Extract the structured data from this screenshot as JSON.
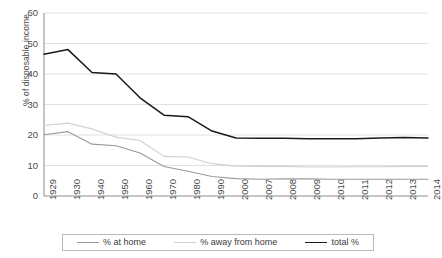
{
  "chart_data": {
    "type": "line",
    "title": "",
    "xlabel": "",
    "ylabel": "% of disposable income",
    "ylim": [
      0,
      60
    ],
    "yticks": [
      0,
      10,
      20,
      30,
      40,
      50,
      60
    ],
    "grid": true,
    "legend_position": "bottom",
    "categories": [
      "1929",
      "1930",
      "1940",
      "1950",
      "1960",
      "1970",
      "1980",
      "1990",
      "2000",
      "2007",
      "2008",
      "2009",
      "2010",
      "2011",
      "2012",
      "2013",
      "2014"
    ],
    "series": [
      {
        "name": "% at home",
        "color": "#9a9a9a",
        "style": "solid",
        "values": [
          20.1,
          21.1,
          17.0,
          16.5,
          14.1,
          9.7,
          8.1,
          6.4,
          5.7,
          5.5,
          5.6,
          5.6,
          5.5,
          5.5,
          5.5,
          5.5,
          5.5
        ]
      },
      {
        "name": "% away from home",
        "color": "#d0d0d0",
        "style": "solid",
        "values": [
          23.1,
          23.9,
          22.0,
          19.3,
          18.2,
          13.0,
          12.8,
          10.6,
          9.8,
          9.7,
          9.7,
          9.5,
          9.5,
          9.6,
          9.6,
          9.7,
          9.7
        ]
      },
      {
        "name": "total %",
        "color": "#1a1a1a",
        "style": "solid",
        "values": [
          46.5,
          48.0,
          40.5,
          40.0,
          32.2,
          26.5,
          26.0,
          21.3,
          19.0,
          18.9,
          18.9,
          18.8,
          18.8,
          18.8,
          19.0,
          19.2,
          19.0
        ]
      }
    ]
  },
  "axis": {
    "y_title": "% of disposable income"
  },
  "legend": {
    "items": [
      {
        "label": "% at home"
      },
      {
        "label": "% away from home"
      },
      {
        "label": "total %"
      }
    ]
  }
}
